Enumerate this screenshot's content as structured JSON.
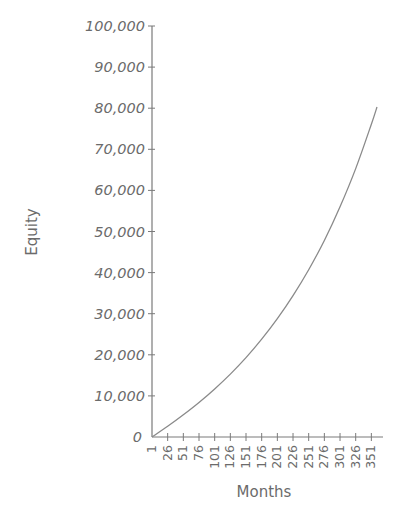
{
  "chart_data": {
    "type": "line",
    "title": "",
    "xlabel": "Months",
    "ylabel": "Equity",
    "xlim": [
      1,
      360
    ],
    "ylim": [
      0,
      100000
    ],
    "grid": false,
    "legend": null,
    "x_ticks": [
      1,
      26,
      51,
      76,
      101,
      126,
      151,
      176,
      201,
      226,
      251,
      276,
      301,
      326,
      351
    ],
    "y_ticks": [
      0,
      10000,
      20000,
      30000,
      40000,
      50000,
      60000,
      70000,
      80000,
      90000,
      100000
    ],
    "y_tick_labels": [
      "0",
      "10,000",
      "20,000",
      "30,000",
      "40,000",
      "50,000",
      "60,000",
      "70,000",
      "80,000",
      "90,000",
      "100,000"
    ],
    "series": [
      {
        "name": "Equity",
        "color": "#8a8a8a",
        "x": [
          1,
          26,
          51,
          76,
          101,
          126,
          151,
          176,
          201,
          226,
          251,
          276,
          301,
          326,
          351,
          360
        ],
        "values": [
          0,
          2600,
          5400,
          8400,
          11700,
          15300,
          19300,
          23800,
          28800,
          34400,
          40700,
          47800,
          56000,
          65300,
          76100,
          80300
        ]
      }
    ]
  },
  "colors": {
    "axis": "#7a7a7a",
    "text": "#6b6b6b",
    "line": "#8a8a8a"
  }
}
